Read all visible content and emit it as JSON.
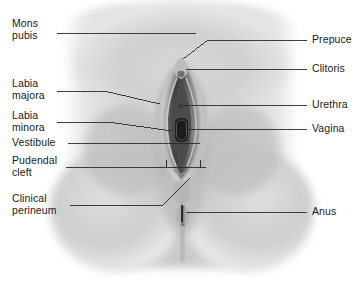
{
  "figure": {
    "background_color": "#ffffff",
    "body_tone_light": "#f2f2f2",
    "body_tone_mid": "#c9c9c9",
    "body_tone_dark": "#7a7a7a",
    "leader_line_color": "#2b2b2b",
    "caption": ""
  },
  "labels_left": [
    {
      "id": "mons-pubis",
      "line1": "Mons",
      "line2": "pubis"
    },
    {
      "id": "labia-majora",
      "line1": "Labia",
      "line2": "majora"
    },
    {
      "id": "labia-minora",
      "line1": "Labia",
      "line2": "minora"
    },
    {
      "id": "vestibule",
      "line1": "Vestibule",
      "line2": ""
    },
    {
      "id": "pudendal-cleft",
      "line1": "Pudendal",
      "line2": "cleft"
    },
    {
      "id": "clinical-perineum",
      "line1": "Clinical",
      "line2": "perineum"
    }
  ],
  "labels_right": [
    {
      "id": "prepuce",
      "line1": "Prepuce"
    },
    {
      "id": "clitoris",
      "line1": "Clitoris"
    },
    {
      "id": "urethra",
      "line1": "Urethra"
    },
    {
      "id": "vagina",
      "line1": "Vagina"
    },
    {
      "id": "anus",
      "line1": "Anus"
    }
  ]
}
